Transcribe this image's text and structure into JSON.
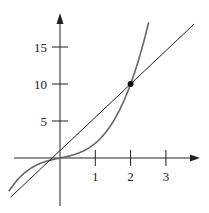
{
  "chart_data": {
    "type": "line",
    "title": "",
    "xlabel": "",
    "ylabel": "",
    "x_ticks": [
      "1",
      "2",
      "3"
    ],
    "y_ticks": [
      "5",
      "10",
      "15"
    ],
    "xlim": [
      -1.7,
      4.0
    ],
    "ylim": [
      -6,
      21
    ],
    "series": [
      {
        "name": "curve",
        "function": "y = x^3 + x",
        "color": "#666666",
        "points": [
          [
            -1.4,
            -4.1
          ],
          [
            -1,
            -2
          ],
          [
            -0.5,
            -0.6
          ],
          [
            0,
            0
          ],
          [
            0.5,
            0.6
          ],
          [
            1,
            2
          ],
          [
            1.5,
            4.9
          ],
          [
            2,
            10
          ],
          [
            2.3,
            14.5
          ],
          [
            2.5,
            18.1
          ]
        ]
      },
      {
        "name": "line",
        "function": "y = 4.5x + 1",
        "color": "#222222",
        "points": [
          [
            -1.4,
            -5.3
          ],
          [
            0,
            1
          ],
          [
            2,
            10
          ],
          [
            3.8,
            18.1
          ]
        ]
      }
    ],
    "annotations": [
      {
        "type": "point",
        "x": 2,
        "y": 10
      }
    ],
    "grid": false,
    "legend": null
  }
}
